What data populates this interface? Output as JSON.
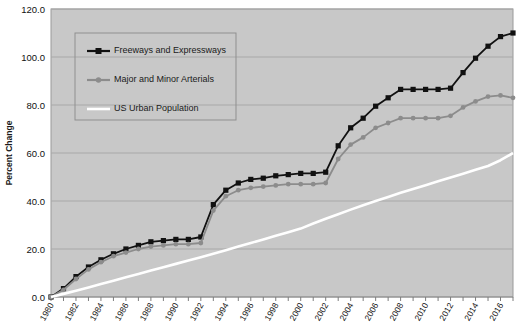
{
  "chart_data": {
    "type": "line",
    "title": "",
    "xlabel": "",
    "ylabel": "Percent Change",
    "ylim": [
      0.0,
      120.0
    ],
    "xlim": [
      1980,
      2017
    ],
    "yticks": [
      "0.0",
      "20.0",
      "40.0",
      "60.0",
      "80.0",
      "100.0",
      "120.0"
    ],
    "ytick_values": [
      0,
      20,
      40,
      60,
      80,
      100,
      120
    ],
    "xticks": [
      "1980",
      "1982",
      "1984",
      "1986",
      "1988",
      "1990",
      "1992",
      "1994",
      "1996",
      "1998",
      "2000",
      "2002",
      "2004",
      "2006",
      "2008",
      "2010",
      "2012",
      "2014",
      "2016"
    ],
    "xtick_values": [
      1980,
      1982,
      1984,
      1986,
      1988,
      1990,
      1992,
      1994,
      1996,
      1998,
      2000,
      2002,
      2004,
      2006,
      2008,
      2010,
      2012,
      2014,
      2016
    ],
    "grid": true,
    "grid_axis": "y",
    "legend_position": "upper-left",
    "plot_background": "#c8c8c8",
    "x": [
      1980,
      1981,
      1982,
      1983,
      1984,
      1985,
      1986,
      1987,
      1988,
      1989,
      1990,
      1991,
      1992,
      1993,
      1994,
      1995,
      1996,
      1997,
      1998,
      1999,
      2000,
      2001,
      2002,
      2003,
      2004,
      2005,
      2006,
      2007,
      2008,
      2009,
      2010,
      2011,
      2012,
      2013,
      2014,
      2015,
      2016,
      2017
    ],
    "series": [
      {
        "name": "Freeways and Expressways",
        "color": "#111111",
        "marker": "square",
        "values": [
          0.0,
          3.5,
          8.5,
          12.5,
          15.5,
          18.0,
          20.0,
          21.5,
          23.0,
          23.5,
          24.0,
          24.0,
          25.0,
          38.5,
          44.5,
          47.5,
          49.0,
          49.5,
          50.5,
          51.0,
          51.5,
          51.5,
          52.0,
          63.0,
          70.5,
          74.5,
          79.5,
          83.0,
          86.5,
          86.5,
          86.5,
          86.5,
          87.0,
          93.5,
          99.5,
          104.5,
          108.5,
          110.0
        ]
      },
      {
        "name": "Major and Minor Arterials",
        "color": "#8c8c8c",
        "marker": "circle",
        "values": [
          0.0,
          3.0,
          7.5,
          11.5,
          14.5,
          17.0,
          18.5,
          20.0,
          21.0,
          21.5,
          22.0,
          22.0,
          22.5,
          36.0,
          42.0,
          44.5,
          45.5,
          46.0,
          46.5,
          47.0,
          47.0,
          47.0,
          47.5,
          57.5,
          63.5,
          66.5,
          70.5,
          72.5,
          74.5,
          74.5,
          74.5,
          74.5,
          75.5,
          79.0,
          81.5,
          83.5,
          84.0,
          83.0
        ]
      },
      {
        "name": "US Urban Population",
        "color": "#ffffff",
        "marker": "none",
        "values": [
          0.0,
          1.3,
          2.6,
          4.0,
          5.4,
          6.8,
          8.2,
          9.6,
          11.0,
          12.4,
          13.8,
          15.2,
          16.6,
          18.0,
          19.5,
          21.0,
          22.5,
          24.0,
          25.5,
          27.0,
          28.5,
          30.6,
          32.6,
          34.5,
          36.4,
          38.2,
          40.0,
          41.7,
          43.4,
          45.0,
          46.6,
          48.2,
          49.8,
          51.4,
          53.0,
          54.6,
          57.0,
          60.0
        ]
      }
    ]
  },
  "legend": {
    "entries": [
      {
        "label": "Freeways and Expressways"
      },
      {
        "label": "Major and Minor Arterials"
      },
      {
        "label": "US Urban Population"
      }
    ]
  }
}
